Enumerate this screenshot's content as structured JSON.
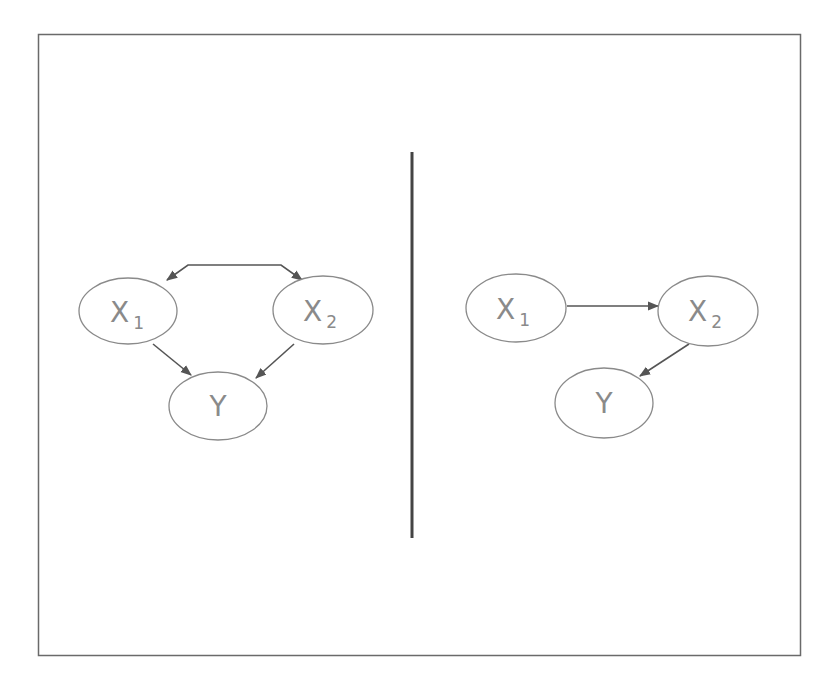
{
  "colors": {
    "background": "#ffffff",
    "frame": "#6a6a6a",
    "divider": "#444444",
    "node_stroke": "#8a8a8a",
    "edge": "#555555",
    "label": "#8a8a8a"
  },
  "left_panel": {
    "nodes": [
      {
        "id": "X1",
        "letter": "X",
        "subscript": "1"
      },
      {
        "id": "X2",
        "letter": "X",
        "subscript": "2"
      },
      {
        "id": "Y",
        "letter": "Y",
        "subscript": ""
      }
    ],
    "edges": [
      {
        "from": "X1",
        "to": "X2",
        "type": "bidirected"
      },
      {
        "from": "X1",
        "to": "Y",
        "type": "directed"
      },
      {
        "from": "X2",
        "to": "Y",
        "type": "directed"
      }
    ]
  },
  "right_panel": {
    "nodes": [
      {
        "id": "X1",
        "letter": "X",
        "subscript": "1"
      },
      {
        "id": "X2",
        "letter": "X",
        "subscript": "2"
      },
      {
        "id": "Y",
        "letter": "Y",
        "subscript": ""
      }
    ],
    "edges": [
      {
        "from": "X1",
        "to": "X2",
        "type": "directed"
      },
      {
        "from": "X2",
        "to": "Y",
        "type": "directed"
      }
    ]
  }
}
